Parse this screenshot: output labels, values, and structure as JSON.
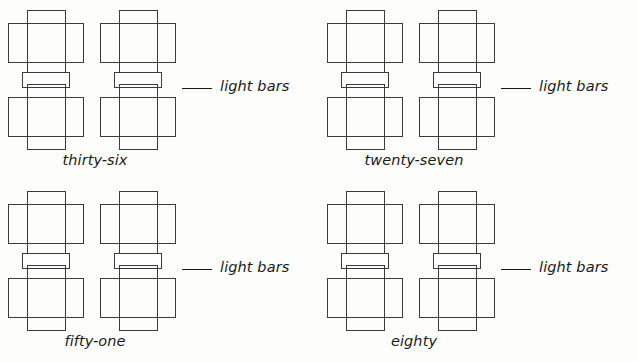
{
  "page": {
    "background_color": "#fdfdfc",
    "ink_color": "#3b3b3b",
    "text_color": "#1a1a1a",
    "width": 638,
    "height": 362
  },
  "problems": [
    {
      "id": "problem-1",
      "number_word": "thirty-six",
      "answer_blank": "",
      "unit_label": "light bars",
      "figure": {
        "net_count": 2,
        "net_description": "cube-net cross outline"
      }
    },
    {
      "id": "problem-2",
      "number_word": "twenty-seven",
      "answer_blank": "",
      "unit_label": "light bars",
      "figure": {
        "net_count": 2,
        "net_description": "cube-net cross outline"
      }
    },
    {
      "id": "problem-3",
      "number_word": "fifty-one",
      "answer_blank": "",
      "unit_label": "light bars",
      "figure": {
        "net_count": 2,
        "net_description": "cube-net cross outline"
      }
    },
    {
      "id": "problem-4",
      "number_word": "eighty",
      "answer_blank": "",
      "unit_label": "light bars",
      "figure": {
        "net_count": 2,
        "net_description": "cube-net cross outline"
      }
    }
  ]
}
